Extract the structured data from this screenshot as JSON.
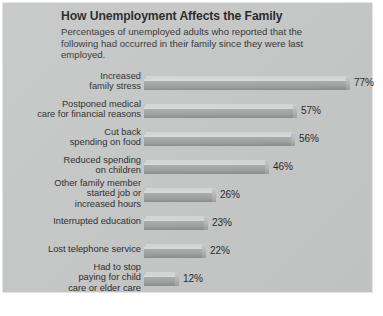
{
  "chart_data": {
    "type": "bar",
    "orientation": "horizontal",
    "title": "How Unemployment Affects the Family",
    "subtitle": "Percentages of unemployed adults who reported that the following had occurred in their family since they were last employed.",
    "xlabel": "",
    "ylabel": "",
    "xlim": [
      0,
      85
    ],
    "grid": false,
    "legend": null,
    "value_suffix": "%",
    "categories": [
      "Increased family stress",
      "Postponed medical care for financial reasons",
      "Cut back spending on food",
      "Reduced spending on children",
      "Other family member started job or increased hours",
      "Interrupted education",
      "Lost telephone service",
      "Had to stop paying for child care or elder care"
    ],
    "values": [
      77,
      57,
      56,
      46,
      26,
      23,
      22,
      12
    ],
    "data_labels": [
      "77%",
      "57%",
      "56%",
      "46%",
      "26%",
      "23%",
      "22%",
      "12%"
    ],
    "category_lines": [
      [
        "Increased",
        "family stress"
      ],
      [
        "Postponed medical",
        "care for financial reasons"
      ],
      [
        "Cut back",
        "spending on food"
      ],
      [
        "Reduced spending",
        "on children"
      ],
      [
        "Other family member",
        "started job or",
        "increased hours"
      ],
      [
        "Interrupted education"
      ],
      [
        "Lost telephone service"
      ],
      [
        "Had to stop",
        "paying for child",
        "care or elder care"
      ]
    ],
    "colors": {
      "background": "#c3c4c4",
      "bar_fill": "#9d9e9e",
      "bar_highlight": "#d8d8d8",
      "text": "#1f1f1f",
      "title_text": "#1b1b1b"
    }
  }
}
